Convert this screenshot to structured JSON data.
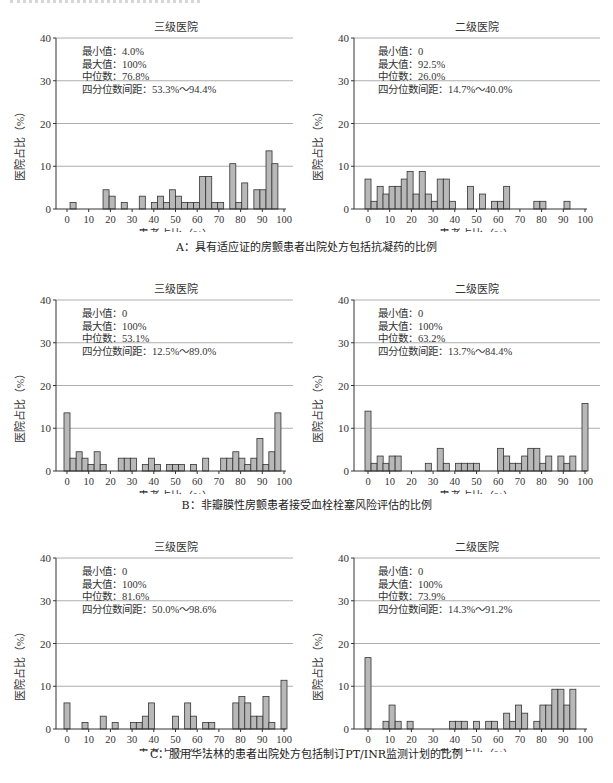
{
  "figures": [
    {
      "caption": "A：具有适应证的房颤患者出院处方包括抗凝药的比例",
      "panels": [
        {
          "title": "三级医院",
          "stats": [
            "最小值：4.0%",
            "最大值：100%",
            "中位数：76.8%",
            "四分位数间距：53.3%～94.4%"
          ]
        },
        {
          "title": "二级医院",
          "stats": [
            "最小值：0",
            "最大值：92.5%",
            "中位数：26.0%",
            "四分位数间距：14.7%～40.0%"
          ]
        }
      ]
    },
    {
      "caption": "B：非瓣膜性房颤患者接受血栓栓塞风险评估的比例",
      "panels": [
        {
          "title": "三级医院",
          "stats": [
            "最小值：0",
            "最大值：100%",
            "中位数：53.1%",
            "四分位数间距：12.5%～89.0%"
          ]
        },
        {
          "title": "二级医院",
          "stats": [
            "最小值：0",
            "最大值：100%",
            "中位数：63.2%",
            "四分位数间距：13.7%～84.4%"
          ]
        }
      ]
    },
    {
      "caption": "C：服用华法林的患者出院处方包括制订PT/INR监测计划的比例",
      "panels": [
        {
          "title": "三级医院",
          "stats": [
            "最小值：0",
            "最大值：100%",
            "中位数：81.6%",
            "四分位数间距：50.0%～98.6%"
          ]
        },
        {
          "title": "二级医院",
          "stats": [
            "最小值：0",
            "最大值：100%",
            "中位数：73.9%",
            "四分位数间距：14.3%～91.2%"
          ]
        }
      ]
    }
  ],
  "axes": {
    "xlabel": "患者占比（%）",
    "ylabel": "医院占比（%）",
    "xticks": [
      "0",
      "10",
      "20",
      "30",
      "40",
      "50",
      "60",
      "70",
      "80",
      "90",
      "100"
    ],
    "yticks": [
      "0",
      "10",
      "20",
      "30",
      "40"
    ]
  },
  "colors": {
    "bar_fill": "#b8b8b8",
    "bar_stroke": "#333333",
    "grid": "#999999",
    "axis": "#333333"
  },
  "chart_data": [
    {
      "type": "bar",
      "title": "A 三级医院",
      "xlabel": "患者占比（%）",
      "ylabel": "医院占比（%）",
      "xlim": [
        0,
        100
      ],
      "ylim": [
        0,
        40
      ],
      "grid": "horizontal",
      "x": [
        2.8,
        18,
        20.8,
        26.4,
        34.7,
        40.3,
        43.1,
        45.8,
        48.6,
        51.4,
        54.2,
        56.9,
        59.7,
        62.5,
        65.3,
        68.1,
        70.8,
        76.4,
        79.2,
        81.9,
        87.5,
        90.3,
        93.1,
        95.8,
        98.6
      ],
      "values": [
        1.5,
        4.5,
        3.0,
        1.5,
        3.0,
        1.5,
        3.0,
        1.5,
        4.5,
        3.0,
        1.5,
        1.5,
        1.5,
        7.6,
        7.6,
        1.5,
        1.5,
        10.6,
        1.5,
        6.1,
        4.5,
        4.5,
        13.6,
        10.6,
        0
      ]
    },
    {
      "type": "bar",
      "title": "A 二级医院",
      "xlabel": "患者占比（%）",
      "ylabel": "医院占比（%）",
      "xlim": [
        0,
        100
      ],
      "ylim": [
        0,
        40
      ],
      "grid": "horizontal",
      "x": [
        0,
        2.8,
        5.6,
        8.3,
        11.1,
        13.9,
        16.7,
        19.4,
        22.2,
        25,
        27.8,
        30.6,
        33.3,
        36.1,
        38.9,
        41.7,
        47.2,
        52.8,
        58.3,
        61.1,
        63.9,
        77.8,
        80.6,
        91.7
      ],
      "values": [
        7.0,
        1.8,
        5.3,
        3.5,
        5.3,
        5.3,
        7.0,
        8.8,
        3.5,
        8.8,
        3.5,
        1.8,
        7.0,
        7.0,
        1.8,
        0,
        5.3,
        3.5,
        1.8,
        1.8,
        5.3,
        1.8,
        1.8,
        1.8
      ]
    },
    {
      "type": "bar",
      "title": "B 三级医院",
      "xlabel": "患者占比（%）",
      "ylabel": "医院占比（%）",
      "xlim": [
        0,
        100
      ],
      "ylim": [
        0,
        40
      ],
      "grid": "horizontal",
      "x": [
        0,
        2.8,
        5.6,
        8.3,
        11.1,
        13.9,
        16.7,
        25,
        27.8,
        30.6,
        36.1,
        38.9,
        41.7,
        47.2,
        50,
        52.8,
        58.3,
        63.9,
        72.2,
        75,
        77.8,
        80.6,
        83.3,
        86.1,
        88.9,
        91.7,
        94.4,
        97.2,
        100
      ],
      "values": [
        13.6,
        3.0,
        4.5,
        3.0,
        1.5,
        4.5,
        1.5,
        3.0,
        3.0,
        3.0,
        1.5,
        3.0,
        1.5,
        1.5,
        1.5,
        1.5,
        1.5,
        3.0,
        3.0,
        3.0,
        4.5,
        3.0,
        1.5,
        3.0,
        7.6,
        1.5,
        4.5,
        13.6,
        0
      ]
    },
    {
      "type": "bar",
      "title": "B 二级医院",
      "xlabel": "患者占比（%）",
      "ylabel": "医院占比（%）",
      "xlim": [
        0,
        100
      ],
      "ylim": [
        0,
        40
      ],
      "grid": "horizontal",
      "x": [
        0,
        2.8,
        5.6,
        8.3,
        11.1,
        13.9,
        27.8,
        33.3,
        36.1,
        41.7,
        44.4,
        47.2,
        50,
        61.1,
        63.9,
        66.7,
        69.4,
        72.2,
        75,
        77.8,
        80.6,
        83.3,
        88.9,
        91.7,
        94.4,
        100
      ],
      "values": [
        14.0,
        1.8,
        3.5,
        1.8,
        3.5,
        3.5,
        1.8,
        5.3,
        1.8,
        1.8,
        1.8,
        1.8,
        1.8,
        5.3,
        3.5,
        1.8,
        1.8,
        3.5,
        5.3,
        5.3,
        1.8,
        3.5,
        3.5,
        1.8,
        3.5,
        15.8
      ]
    },
    {
      "type": "bar",
      "title": "C 三级医院",
      "xlabel": "患者占比（%）",
      "ylabel": "医院占比（%）",
      "xlim": [
        0,
        100
      ],
      "ylim": [
        0,
        40
      ],
      "grid": "horizontal",
      "x": [
        0,
        8.3,
        16.7,
        22.2,
        30.6,
        33.3,
        36.1,
        38.9,
        50,
        55.6,
        58.3,
        63.9,
        66.7,
        77.8,
        80.6,
        83.3,
        86.1,
        88.9,
        91.7,
        94.4,
        100
      ],
      "values": [
        6.1,
        1.5,
        3.0,
        1.5,
        1.5,
        1.5,
        3.0,
        6.1,
        3.0,
        6.1,
        3.0,
        1.5,
        1.5,
        6.1,
        7.6,
        6.1,
        3.0,
        3.0,
        7.6,
        1.5,
        11.4
      ]
    },
    {
      "type": "bar",
      "title": "C 二级医院",
      "xlabel": "患者占比（%）",
      "ylabel": "医院占比（%）",
      "xlim": [
        0,
        100
      ],
      "ylim": [
        0,
        40
      ],
      "grid": "horizontal",
      "x": [
        0,
        8.3,
        11.1,
        13.9,
        19.4,
        38.9,
        41.7,
        44.4,
        50,
        55.6,
        58.3,
        63.9,
        66.7,
        69.4,
        72.2,
        77.8,
        80.6,
        83.3,
        86.1,
        88.9,
        91.7,
        94.4,
        97.2
      ],
      "values": [
        16.7,
        1.8,
        5.6,
        1.8,
        1.8,
        1.8,
        1.8,
        1.8,
        1.8,
        1.8,
        1.8,
        3.7,
        1.8,
        5.6,
        3.7,
        1.8,
        5.6,
        5.6,
        9.3,
        9.3,
        5.6,
        9.3,
        0
      ]
    }
  ]
}
